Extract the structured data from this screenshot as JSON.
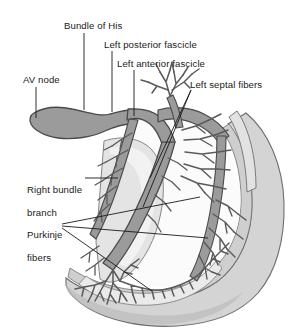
{
  "figure": {
    "background_color": "#ffffff"
  },
  "palette": {
    "conduction_fill": "#9b9b9b",
    "conduction_stroke": "#4a4a4a",
    "myocardium_fill": "#d4d4d4",
    "myocardium_stroke": "#6e6e6e",
    "endocardium_fill": "#e8e8e8",
    "fiber_stroke": "#5a5a5a",
    "leader_line": "#1a1a1a",
    "text": "#1a1a1a"
  },
  "labels": {
    "bundle_of_his": "Bundle of His",
    "left_posterior_fascicle": "Left posterior fascicle",
    "left_anterior_fascicle": "Left anterior fascicle",
    "left_septal_fibers": "Left septal fibers",
    "av_node": "AV node",
    "right_bundle_branch_line1": "Right bundle",
    "right_bundle_branch_line2": "branch",
    "purkinje_line1": "Purkinje",
    "purkinje_line2": "fibers"
  },
  "structures": [
    {
      "name": "av-node",
      "label": "AV node",
      "description": "teardrop-shaped gray node at upper left"
    },
    {
      "name": "bundle-of-his",
      "label": "Bundle of His",
      "description": "gray trunk descending from AV node"
    },
    {
      "name": "left-posterior-fascicle",
      "label": "Left posterior fascicle",
      "description": "branch descending along posterior septum"
    },
    {
      "name": "left-anterior-fascicle",
      "label": "Left anterior fascicle",
      "description": "branch ascending anteriorly"
    },
    {
      "name": "left-septal-fibers",
      "label": "Left septal fibers",
      "description": "fine fibers fanning across the septum"
    },
    {
      "name": "right-bundle-branch",
      "label": "Right bundle branch",
      "description": "long branch running down the right side of the septum"
    },
    {
      "name": "purkinje-fibers",
      "label": "Purkinje fibers",
      "description": "terminal arborizing network at the ventricular apex"
    }
  ]
}
